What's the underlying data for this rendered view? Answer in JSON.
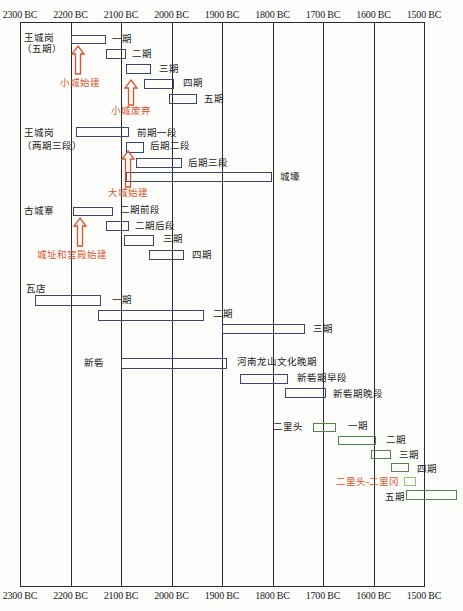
{
  "axis": {
    "ticks": [
      "2300 BC",
      "2200 BC",
      "2100 BC",
      "2000 BC",
      "1900 BC",
      "1800 BC",
      "1700 BC",
      "1600 BC",
      "1500 BC"
    ]
  },
  "chart_data": {
    "type": "timeline",
    "title": "",
    "xlabel": "",
    "ylabel": "",
    "x_ticks": [
      "2300 BC",
      "2200 BC",
      "2100 BC",
      "2000 BC",
      "1900 BC",
      "1800 BC",
      "1700 BC",
      "1600 BC",
      "1500 BC"
    ],
    "xlim": [
      2300,
      1500
    ],
    "grid": true,
    "legend": null,
    "series": [
      {
        "name": "王城岗（五期）",
        "name_line1": "王城岗",
        "name_line2": "（五期）",
        "color": "#3b4670",
        "phases": [
          {
            "label": "一期",
            "start": 2200,
            "end": 2130
          },
          {
            "label": "二期",
            "start": 2130,
            "end": 2090
          },
          {
            "label": "三期",
            "start": 2090,
            "end": 2040
          },
          {
            "label": "四期",
            "start": 2055,
            "end": 1995
          },
          {
            "label": "五期",
            "start": 2005,
            "end": 1950
          }
        ]
      },
      {
        "name": "王城岗（两期三段）",
        "name_line1": "王城岗",
        "name_line2": "（两期三段）",
        "color": "#3b4670",
        "phases": [
          {
            "label": "前期一段",
            "start": 2190,
            "end": 2085
          },
          {
            "label": "后期二段",
            "start": 2090,
            "end": 2055
          },
          {
            "label": "后期三段",
            "start": 2070,
            "end": 1980
          },
          {
            "label": "城壕",
            "start": 2090,
            "end": 1800
          }
        ]
      },
      {
        "name": "古城寨",
        "name_line1": "古城寨",
        "color": "#3b4670",
        "phases": [
          {
            "label": "二期前段",
            "start": 2195,
            "end": 2115
          },
          {
            "label": "二期后段",
            "start": 2130,
            "end": 2085
          },
          {
            "label": "三期",
            "start": 2095,
            "end": 2035
          },
          {
            "label": "四期",
            "start": 2045,
            "end": 1975
          }
        ]
      },
      {
        "name": "瓦店",
        "name_line1": "瓦店",
        "color": "#3b4670",
        "phases": [
          {
            "label": "一期",
            "start": 2270,
            "end": 2140
          },
          {
            "label": "二期",
            "start": 2145,
            "end": 1935
          },
          {
            "label": "三期",
            "start": 1900,
            "end": 1735
          }
        ]
      },
      {
        "name": "新砦",
        "name_line1": "新砦",
        "color": "#3b4670",
        "phases": [
          {
            "label": "河南龙山文化晚期",
            "start": 2100,
            "end": 1890
          },
          {
            "label": "新砦期早段",
            "start": 1865,
            "end": 1770
          },
          {
            "label": "新砦期晚段",
            "start": 1775,
            "end": 1695
          }
        ]
      },
      {
        "name": "二里头",
        "name_line1": "二里头",
        "color": "#55804f",
        "phases": [
          {
            "label": "一期",
            "start": 1720,
            "end": 1675
          },
          {
            "label": "二期",
            "start": 1670,
            "end": 1595
          },
          {
            "label": "三期",
            "start": 1605,
            "end": 1565
          },
          {
            "label": "四期",
            "start": 1565,
            "end": 1530
          },
          {
            "label": "二里头-二里冈",
            "start": 1540,
            "end": 1515,
            "color": "#93c06a",
            "label_color": "#d9542b"
          },
          {
            "label": "五期",
            "start": 1535,
            "end": 1435
          }
        ]
      }
    ],
    "annotations": [
      {
        "text": "小城始建",
        "year": 2185,
        "series": "王城岗（五期）",
        "color": "#d9542b",
        "type": "up-arrow"
      },
      {
        "text": "小城废弃",
        "year": 2080,
        "series": "王城岗（五期）",
        "color": "#d9542b",
        "type": "up-arrow"
      },
      {
        "text": "大城始建",
        "year": 2086,
        "series": "王城岗（两期三段）",
        "color": "#d9542b",
        "type": "up-arrow"
      },
      {
        "text": "城址和宫殿始建",
        "year": 2183,
        "series": "古城寨",
        "color": "#d9542b",
        "type": "up-arrow"
      }
    ]
  }
}
